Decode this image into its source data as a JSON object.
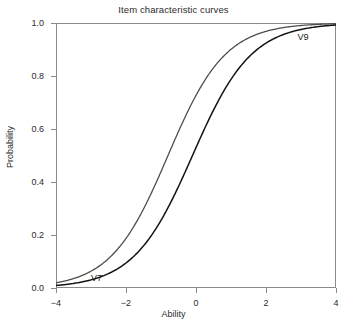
{
  "chart_data": {
    "type": "line",
    "title": "Item characteristic curves",
    "xlabel": "Ability",
    "ylabel": "Probability",
    "xlim": [
      -4,
      4
    ],
    "ylim": [
      0,
      1
    ],
    "xticks": [
      "-4",
      "-2",
      "0",
      "2",
      "4"
    ],
    "xtick_values": [
      -4,
      -2,
      0,
      2,
      4
    ],
    "yticks": [
      "0.0",
      "0.2",
      "0.4",
      "0.6",
      "0.8",
      "1.0"
    ],
    "ytick_values": [
      0.0,
      0.2,
      0.4,
      0.6,
      0.8,
      1.0
    ],
    "grid": false,
    "legend": "inline-annotations",
    "annotations": [
      {
        "text": "V9",
        "x": 2.9,
        "y": 0.945
      },
      {
        "text": "V7",
        "x": -3.0,
        "y": 0.035
      }
    ],
    "series": [
      {
        "name": "V9",
        "color": "#4d4d4d",
        "width": 1.3,
        "model": "2PL logistic",
        "discrimination": 0.72,
        "difficulty": -0.8,
        "x": [
          -4,
          -3.5,
          -3,
          -2.5,
          -2,
          -1.5,
          -1,
          -0.5,
          0,
          0.5,
          1,
          1.5,
          2,
          2.5,
          3,
          3.5,
          4
        ],
        "y": [
          0.093,
          0.127,
          0.171,
          0.226,
          0.292,
          0.367,
          0.449,
          0.532,
          0.613,
          0.688,
          0.754,
          0.809,
          0.854,
          0.889,
          0.916,
          0.937,
          0.953
        ]
      },
      {
        "name": "V7",
        "color": "#141414",
        "width": 1.5,
        "model": "2PL logistic",
        "discrimination": 0.7,
        "difficulty": -0.1,
        "x": [
          -4,
          -3.5,
          -3,
          -2.5,
          -2,
          -1.5,
          -1,
          -0.5,
          0,
          0.5,
          1,
          1.5,
          2,
          2.5,
          3,
          3.5,
          4
        ],
        "y": [
          0.06,
          0.083,
          0.114,
          0.154,
          0.204,
          0.265,
          0.335,
          0.411,
          0.49,
          0.568,
          0.641,
          0.708,
          0.766,
          0.814,
          0.854,
          0.886,
          0.911
        ]
      }
    ]
  },
  "chart": {
    "title": "Item characteristic curves",
    "x_title": "Ability",
    "y_title": "Probability"
  }
}
